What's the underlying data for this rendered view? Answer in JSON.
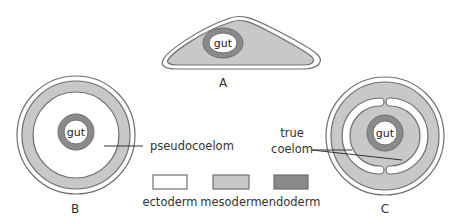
{
  "colors": {
    "ectoderm": "#ffffff",
    "mesoderm": "#c8c8c8",
    "endoderm": "#8a8a8a",
    "stroke": "#6f6f6f",
    "text": "#333333"
  },
  "figures": {
    "A": {
      "caption": "A",
      "gut_label": "gut"
    },
    "B": {
      "caption": "B",
      "gut_label": "gut",
      "pointer_label": "pseudocoelom"
    },
    "C": {
      "caption": "C",
      "gut_label": "gut",
      "pointer_label_line1": "true",
      "pointer_label_line2": "coelom"
    }
  },
  "legend": {
    "items": [
      {
        "label": "ectoderm",
        "color": "#ffffff"
      },
      {
        "label": "mesoderm",
        "color": "#c8c8c8"
      },
      {
        "label": "endoderm",
        "color": "#8a8a8a"
      }
    ]
  }
}
